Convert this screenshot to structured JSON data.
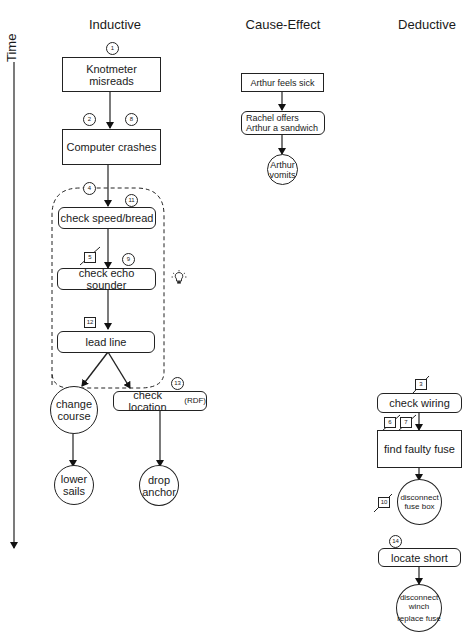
{
  "axis": {
    "label": "Time"
  },
  "columns": {
    "inductive": {
      "heading": "Inductive",
      "nodes": {
        "knotmeter": "Knotmeter misreads",
        "computer": "Computer crashes",
        "check_speed": "check speed/bread",
        "check_echo": "check echo sounder",
        "lead_line": "lead line",
        "change_course": "change course",
        "check_location": "check location",
        "check_location_suffix": "(RDF)",
        "lower_sails": "lower sails",
        "drop_anchor": "drop anchor"
      },
      "markers": {
        "m1": "1",
        "m2": "2",
        "m8": "8",
        "m4": "4",
        "m11": "11",
        "m_crossed": "5",
        "m9": "9",
        "m12": "12",
        "m13": "13"
      },
      "icons": {
        "insight": "lightbulb-icon"
      }
    },
    "cause_effect": {
      "heading": "Cause-Effect",
      "nodes": {
        "feels_sick": "Arthur feels sick",
        "offers_sandwich": "Rachel offers Arthur a sandwich",
        "vomits": "Arthur vomits"
      }
    },
    "deductive": {
      "heading": "Deductive",
      "nodes": {
        "check_wiring": "check wiring",
        "find_fuse": "find faulty fuse",
        "disconnect_fuse_box": "disconnect fuse box",
        "locate_short": "locate short",
        "disconnect_winch": "disconnect winch",
        "replace_fuse": "replace fuse"
      },
      "markers": {
        "crossed_a": "3",
        "crossed_b": "6",
        "crossed_c": "7",
        "crossed_d": "10",
        "m14": "14"
      }
    }
  }
}
